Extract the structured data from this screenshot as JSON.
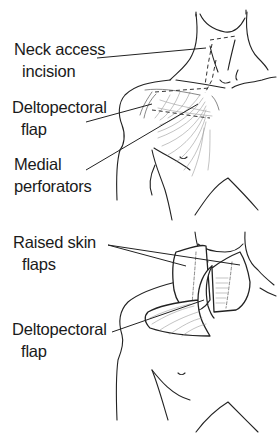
{
  "figure": {
    "panels": [
      {
        "id": "top",
        "description": "Incision markings on chest and neck",
        "labels": [
          {
            "line1": "Neck access",
            "line2": "incision"
          },
          {
            "line1": "Deltopectoral",
            "line2": "flap"
          },
          {
            "line1": "Medial",
            "line2": "perforators"
          }
        ]
      },
      {
        "id": "bottom",
        "description": "Flaps raised",
        "labels": [
          {
            "line1": "Raised skin",
            "line2": "flaps"
          },
          {
            "line1": "Deltopectoral",
            "line2": "flap"
          }
        ]
      }
    ],
    "colors": {
      "ink": "#222222",
      "background": "#ffffff"
    }
  }
}
